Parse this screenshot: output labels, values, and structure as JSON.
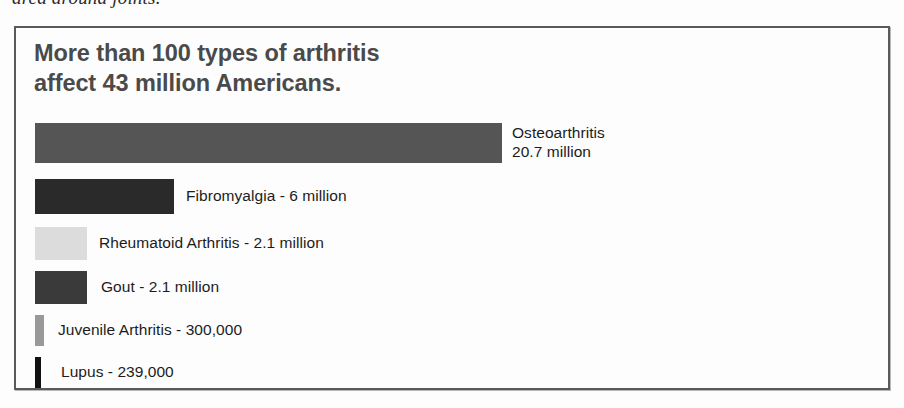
{
  "page": {
    "clipped_body_text": "area around joints."
  },
  "chart_data": {
    "type": "bar",
    "orientation": "horizontal",
    "title": "More than 100 types of arthritis\naffect 43 million Americans.",
    "xlabel": "",
    "ylabel": "",
    "grid": false,
    "legend": "none",
    "axis_visible": false,
    "value_unit": "people affected (U.S.)",
    "total_annotation": "43 million Americans",
    "categories": [
      "Osteoarthritis",
      "Fibromyalgia",
      "Rheumatoid Arthritis",
      "Gout",
      "Juvenile Arthritis",
      "Lupus"
    ],
    "values": [
      20700000,
      6000000,
      2100000,
      2100000,
      300000,
      239000
    ],
    "value_labels": [
      "20.7 million",
      "6 million",
      "2.1 million",
      "2.1 million",
      "300,000",
      "239,000"
    ],
    "bars": [
      {
        "name": "Osteoarthritis",
        "label": "Osteoarthritis\n20.7 million",
        "value": 20700000,
        "value_label": "20.7 million",
        "color": "#555555",
        "bar_width_px": 467,
        "bar_height_px": 40,
        "top_px": 0,
        "label_pad_px": 10
      },
      {
        "name": "Fibromyalgia",
        "label": "Fibromyalgia - 6 million",
        "value": 6000000,
        "value_label": "6 million",
        "color": "#2a2a2a",
        "bar_width_px": 139,
        "bar_height_px": 35,
        "top_px": 56,
        "label_pad_px": 12
      },
      {
        "name": "Rheumatoid Arthritis",
        "label": "Rheumatoid Arthritis - 2.1 million",
        "value": 2100000,
        "value_label": "2.1 million",
        "color": "#dcdcdc",
        "bar_width_px": 52,
        "bar_height_px": 33,
        "top_px": 104,
        "label_pad_px": 12
      },
      {
        "name": "Gout",
        "label": "Gout - 2.1 million",
        "value": 2100000,
        "value_label": "2.1 million",
        "color": "#3a3a3a",
        "bar_width_px": 52,
        "bar_height_px": 33,
        "top_px": 148,
        "label_pad_px": 14
      },
      {
        "name": "Juvenile Arthritis",
        "label": "Juvenile Arthritis - 300,000",
        "value": 300000,
        "value_label": "300,000",
        "color": "#999999",
        "bar_width_px": 9,
        "bar_height_px": 31,
        "top_px": 192,
        "label_pad_px": 14
      },
      {
        "name": "Lupus",
        "label": "Lupus - 239,000",
        "value": 239000,
        "value_label": "239,000",
        "color": "#111111",
        "bar_width_px": 6,
        "bar_height_px": 31,
        "top_px": 234,
        "label_pad_px": 20
      }
    ]
  }
}
